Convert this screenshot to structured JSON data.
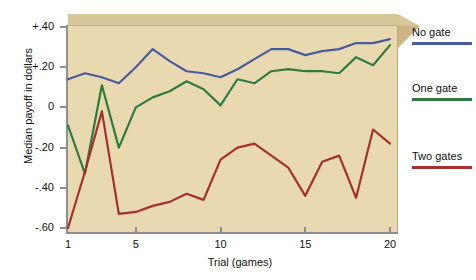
{
  "chart_data": {
    "type": "line",
    "title": "",
    "xlabel": "Trial (games)",
    "ylabel": "Median payoff in dollars",
    "xlim": [
      1,
      20
    ],
    "ylim": [
      -0.6,
      0.4
    ],
    "grid": false,
    "legend_position": "right",
    "x": [
      1,
      2,
      3,
      4,
      5,
      6,
      7,
      8,
      9,
      10,
      11,
      12,
      13,
      14,
      15,
      16,
      17,
      18,
      19,
      20
    ],
    "xticks": [
      1,
      5,
      10,
      15,
      20
    ],
    "xtick_labels": [
      "1",
      "5",
      "10",
      "15",
      "20"
    ],
    "yticks": [
      0.4,
      0.2,
      0,
      -0.2,
      -0.4,
      -0.6
    ],
    "ytick_labels": [
      "+.40",
      "+.20",
      "0",
      "-.20",
      "-.40",
      "-.60"
    ],
    "series": [
      {
        "name": "No gate",
        "color": "#4a5ba0",
        "values": [
          0.14,
          0.17,
          0.15,
          0.12,
          0.2,
          0.29,
          0.23,
          0.18,
          0.17,
          0.15,
          0.19,
          0.24,
          0.29,
          0.29,
          0.26,
          0.28,
          0.29,
          0.32,
          0.32,
          0.34
        ]
      },
      {
        "name": "One gate",
        "color": "#2f7a3f",
        "values": [
          -0.09,
          -0.33,
          0.11,
          -0.2,
          0.0,
          0.05,
          0.08,
          0.13,
          0.09,
          0.01,
          0.14,
          0.12,
          0.18,
          0.19,
          0.18,
          0.18,
          0.17,
          0.25,
          0.21,
          0.31
        ]
      },
      {
        "name": "Two gates",
        "color": "#a6302a",
        "values": [
          -0.6,
          -0.32,
          -0.02,
          -0.53,
          -0.52,
          -0.49,
          -0.47,
          -0.43,
          -0.46,
          -0.26,
          -0.2,
          -0.18,
          -0.24,
          -0.3,
          -0.44,
          -0.27,
          -0.24,
          -0.45,
          -0.11,
          -0.18
        ]
      }
    ]
  },
  "legend": {
    "items": [
      {
        "label": "No gate",
        "color": "#4a5ba0"
      },
      {
        "label": "One gate",
        "color": "#2f7a3f"
      },
      {
        "label": "Two gates",
        "color": "#a6302a"
      }
    ]
  },
  "axes": {
    "x_title": "Trial (games)",
    "y_title": "Median payoff in dollars"
  },
  "colors": {
    "plot_face": "#e9d9b1",
    "box_top": "#d9c79c",
    "box_side": "#cdb585",
    "axis": "#8f8f8f",
    "background": "#ffffff"
  }
}
